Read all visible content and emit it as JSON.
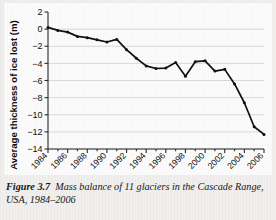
{
  "figure": {
    "caption_label": "Figure 3.7",
    "caption_text": "Mass balance of 11 glaciers in the Cascade Range, USA, 1984–2006"
  },
  "colors": {
    "line": "#111111",
    "grid": "#d8d8d8",
    "axis": "#2a2a2a",
    "panel_bg": "#fbfbfb",
    "page_bg": "#f0efee"
  },
  "chart_data": {
    "type": "line",
    "title": "",
    "xlabel": "",
    "ylabel": "Average thickness of ice lost (m)",
    "xlim": [
      1984,
      2006
    ],
    "ylim": [
      -14,
      2
    ],
    "yticks": [
      2,
      0,
      -2,
      -4,
      -6,
      -8,
      -10,
      -12,
      -14
    ],
    "ytick_labels": [
      "2",
      "0",
      "−2",
      "−4",
      "−6",
      "−8",
      "−10",
      "−12",
      "−14"
    ],
    "xticks": [
      1984,
      1986,
      1988,
      1990,
      1992,
      1994,
      1996,
      1998,
      2000,
      2002,
      2004,
      2006
    ],
    "xtick_labels": [
      "1984",
      "1986",
      "1988",
      "1990",
      "1992",
      "1994",
      "1996",
      "1998",
      "2000",
      "2002",
      "2004",
      "2006"
    ],
    "grid": "horizontal",
    "legend": "none",
    "markers": true,
    "series": [
      {
        "name": "Average thickness of ice lost",
        "x": [
          1984,
          1985,
          1986,
          1987,
          1988,
          1989,
          1990,
          1991,
          1992,
          1993,
          1994,
          1995,
          1996,
          1997,
          1998,
          1999,
          2000,
          2001,
          2002,
          2003,
          2004,
          2005,
          2006
        ],
        "values": [
          0.2,
          -0.15,
          -0.35,
          -0.85,
          -1.0,
          -1.25,
          -1.5,
          -1.2,
          -2.4,
          -3.4,
          -4.3,
          -4.6,
          -4.55,
          -3.9,
          -5.5,
          -3.8,
          -3.7,
          -4.9,
          -4.7,
          -6.4,
          -8.6,
          -11.4,
          -12.3
        ]
      }
    ]
  }
}
